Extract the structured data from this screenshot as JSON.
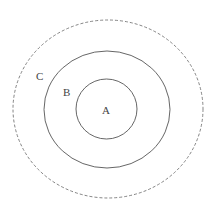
{
  "diagram": {
    "type": "nested-sets",
    "colors": {
      "stroke": "#555555",
      "text": "#444444",
      "background": "#ffffff"
    },
    "sets": [
      {
        "id": "A",
        "label": "A",
        "style": "solid",
        "cx": 106.5,
        "cy": 109,
        "rx": 30.5,
        "ry": 30,
        "label_x": 102,
        "label_y": 114
      },
      {
        "id": "B",
        "label": "B",
        "style": "solid",
        "cx": 107,
        "cy": 109.5,
        "rx": 63,
        "ry": 58.5,
        "label_x": 63,
        "label_y": 96
      },
      {
        "id": "C",
        "label": "C",
        "style": "dashed",
        "cx": 108,
        "cy": 109,
        "rx": 95,
        "ry": 89,
        "label_x": 36,
        "label_y": 80
      }
    ]
  }
}
